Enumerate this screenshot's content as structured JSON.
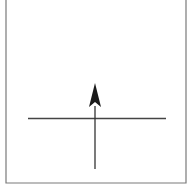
{
  "diagram": {
    "frame": {
      "left": 6,
      "right": 186,
      "top": 0,
      "bottom": 183,
      "color": "#7a7a7a",
      "stroke_width": 1.2
    },
    "horizontal_line": {
      "x1": 28,
      "x2": 166,
      "y": 118.5,
      "color": "#444444",
      "stroke_width": 1.3
    },
    "vertical_arrow": {
      "x": 95,
      "y_start": 169,
      "y_end": 106,
      "color": "#333333",
      "stroke_width": 1.3,
      "head": {
        "tip_y": 83,
        "base_y": 107,
        "half_width": 6,
        "notch_y": 102,
        "color": "#1a1a1a"
      },
      "direction": "up"
    }
  }
}
